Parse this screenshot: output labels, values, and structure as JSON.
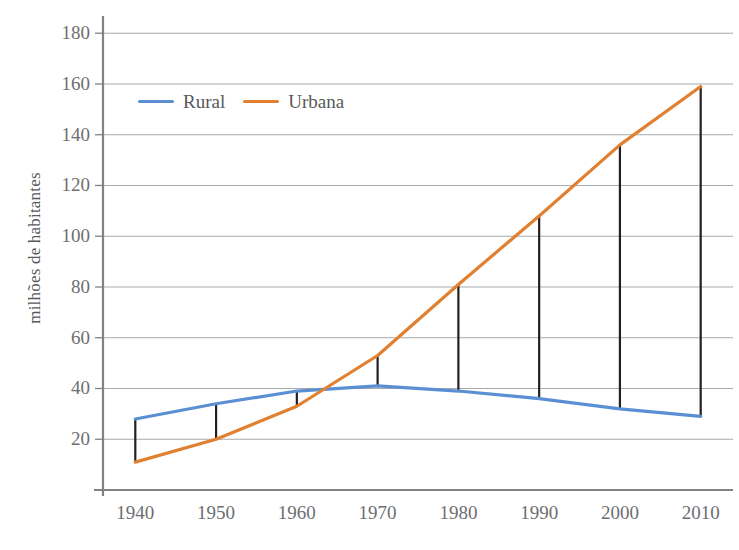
{
  "chart_data": {
    "type": "line",
    "title": "",
    "xlabel": "",
    "ylabel": "milhões de habitantes",
    "x": [
      1940,
      1950,
      1960,
      1970,
      1980,
      1990,
      2000,
      2010
    ],
    "xticklabels": [
      "1940",
      "1950",
      "1960",
      "1970",
      "1980",
      "1990",
      "2000",
      "2010"
    ],
    "yticks": [
      20,
      40,
      60,
      80,
      100,
      120,
      140,
      160,
      180
    ],
    "yticklabels": [
      "20",
      "40",
      "60",
      "80",
      "100",
      "120",
      "140",
      "160",
      "180"
    ],
    "ylim": [
      0,
      186
    ],
    "xlim": [
      1936,
      2014
    ],
    "grid": "horizontal",
    "legend_position": "upper-left-inside",
    "series": [
      {
        "name": "Rural",
        "color": "#5b8fd4",
        "values": [
          28,
          34,
          39,
          41,
          39,
          36,
          32,
          29
        ]
      },
      {
        "name": "Urbana",
        "color": "#e08030",
        "values": [
          11,
          20,
          33,
          53,
          81,
          108,
          136,
          159
        ]
      }
    ],
    "connectors": {
      "name": "vertical-gap-connectors",
      "color": "#231f20",
      "description": "vertical black segments joining Rural and Urbana at each decade"
    }
  },
  "legend": {
    "entries": [
      {
        "label": "Rural",
        "color": "#5b8fd4"
      },
      {
        "label": "Urbana",
        "color": "#e08030"
      }
    ]
  },
  "axes": {
    "y_title": "milhões de habitantes",
    "axis_color": "#808285",
    "grid_color": "#a7a9ac"
  }
}
